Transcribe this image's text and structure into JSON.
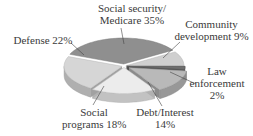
{
  "chart_data": {
    "type": "pie",
    "style": "3d-exploded",
    "title": "",
    "slices": [
      {
        "label": "Social security/ Medicare",
        "value": 35,
        "color": "#8f8f8f"
      },
      {
        "label": "Community development",
        "value": 9,
        "color": "#cfcfcf"
      },
      {
        "label": "Law enforcement",
        "value": 2,
        "color": "#6e6e6e"
      },
      {
        "label": "Debt/Interest",
        "value": 14,
        "color": "#b9b9b9"
      },
      {
        "label": "Social programs",
        "value": 18,
        "color": "#ececec"
      },
      {
        "label": "Defense",
        "value": 22,
        "color": "#d6d6d6"
      }
    ],
    "legend": "none (callout labels)"
  },
  "labels": {
    "ss_line1": "Social security/",
    "ss_line2": "Medicare 35%",
    "cd_line1": "Community",
    "cd_line2": "development 9%",
    "le_line1": "Law",
    "le_line2": "enforcement",
    "le_line3": "2%",
    "debt_line1": "Debt/Interest",
    "debt_line2": "14%",
    "sp_line1": "Social",
    "sp_line2": "programs 18%",
    "def_line1": "Defense 22%"
  }
}
